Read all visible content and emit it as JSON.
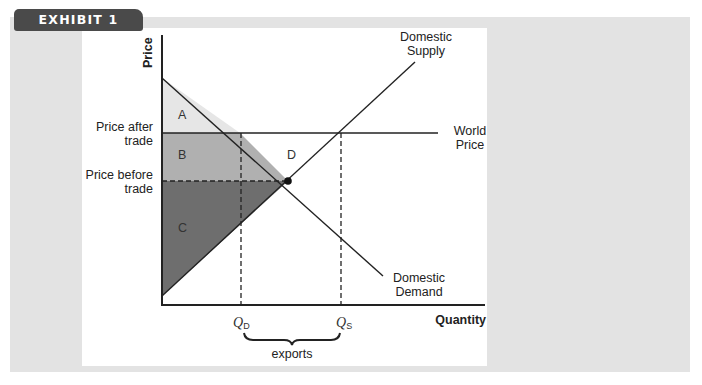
{
  "exhibit": {
    "label": "EXHIBIT 1"
  },
  "axes": {
    "y_label": "Price",
    "x_label": "Quantity"
  },
  "price_levels": {
    "after_trade": {
      "line1": "Price after",
      "line2": "trade"
    },
    "before_trade": {
      "line1": "Price before",
      "line2": "trade"
    }
  },
  "curves": {
    "supply": {
      "line1": "Domestic",
      "line2": "Supply"
    },
    "demand": {
      "line1": "Domestic",
      "line2": "Demand"
    },
    "world_price": {
      "line1": "World",
      "line2": "Price"
    }
  },
  "regions": {
    "A": "A",
    "B": "B",
    "C": "C",
    "D": "D"
  },
  "quantities": {
    "qd": {
      "main": "Q",
      "sub": "D"
    },
    "qs": {
      "main": "Q",
      "sub": "S"
    },
    "brace_label": "exports"
  },
  "colors": {
    "region_A": "#e6e6e6",
    "region_B": "#b0b0b0",
    "region_C": "#6e6e6e",
    "tab": "#4a4a4a",
    "background": "#e3e3e3"
  }
}
